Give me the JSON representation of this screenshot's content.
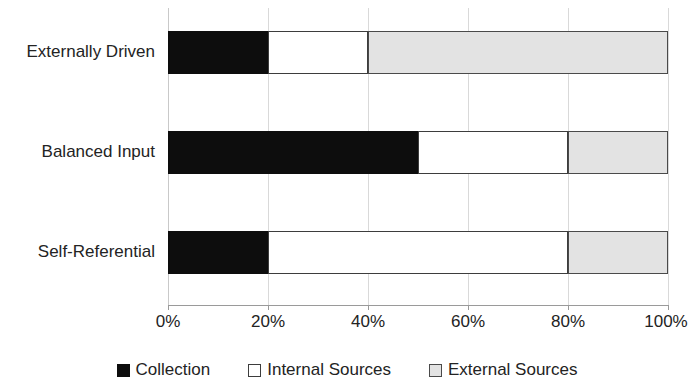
{
  "chart_data": {
    "type": "bar",
    "orientation": "horizontal",
    "stacked": true,
    "stack_mode": "percent",
    "title": "",
    "subtitle": "",
    "xlabel": "",
    "ylabel": "",
    "categories": [
      "Externally Driven",
      "Balanced Input",
      "Self-Referential"
    ],
    "series": [
      {
        "name": "Collection",
        "color": "#0d0d0d",
        "values": [
          20,
          50,
          20
        ]
      },
      {
        "name": "Internal Sources",
        "color": "#ffffff",
        "values": [
          20,
          30,
          60
        ]
      },
      {
        "name": "External Sources",
        "color": "#e3e3e3",
        "values": [
          60,
          20,
          20
        ]
      }
    ],
    "xlim": [
      0,
      100
    ],
    "xticks": [
      0,
      20,
      40,
      60,
      80,
      100
    ],
    "xtick_labels": [
      "0%",
      "20%",
      "40%",
      "60%",
      "80%",
      "100%"
    ],
    "grid": "vertical",
    "legend_position": "bottom"
  },
  "axis": {
    "ticks": [
      {
        "value": 0,
        "label": "0%"
      },
      {
        "value": 20,
        "label": "20%"
      },
      {
        "value": 40,
        "label": "40%"
      },
      {
        "value": 60,
        "label": "60%"
      },
      {
        "value": 80,
        "label": "80%"
      },
      {
        "value": 100,
        "label": "100%"
      }
    ]
  },
  "categories": [
    {
      "label": "Externally Driven"
    },
    {
      "label": "Balanced Input"
    },
    {
      "label": "Self-Referential"
    }
  ],
  "legend": {
    "items": [
      {
        "label": "Collection",
        "swatch": "filled-black-square"
      },
      {
        "label": "Internal Sources",
        "swatch": "outlined-white-square"
      },
      {
        "label": "External Sources",
        "swatch": "filled-gray-square"
      }
    ]
  },
  "colors": {
    "collection": "#0d0d0d",
    "internal_sources": "#ffffff",
    "external_sources": "#e3e3e3",
    "gridline": "#d9d9d9",
    "axis": "#9a9a9a",
    "text": "#232323",
    "background": "#ffffff"
  }
}
